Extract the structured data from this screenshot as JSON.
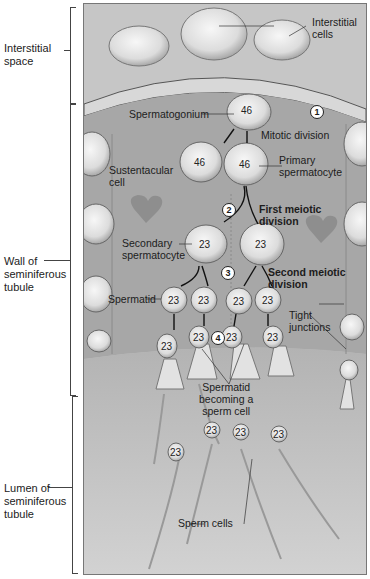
{
  "side_labels": {
    "interstitial_space": [
      "Interstitial",
      "space"
    ],
    "wall": [
      "Wall of",
      "seminiferous",
      "tubule"
    ],
    "lumen": [
      "Lumen of",
      "seminiferous",
      "tubule"
    ]
  },
  "labels": {
    "interstitial_cells": [
      "Interstitial",
      "cells"
    ],
    "spermatogonium": "Spermatogonium",
    "mitotic_division": "Mitotic division",
    "sustentacular_cell": [
      "Sustentacular",
      "cell"
    ],
    "primary_spermatocyte": [
      "Primary",
      "spermatocyte"
    ],
    "first_meiotic": [
      "First meiotic",
      "division"
    ],
    "secondary_spermatocyte": [
      "Secondary",
      "spermatocyte"
    ],
    "second_meiotic": [
      "Second meiotic",
      "division"
    ],
    "spermatid": "Spermatid",
    "tight_junctions": [
      "Tight",
      "junctions"
    ],
    "spermatid_becoming": [
      "Spermatid",
      "becoming a",
      "sperm cell"
    ],
    "sperm_cells": "Sperm cells"
  },
  "steps": [
    "1",
    "2",
    "3",
    "4"
  ],
  "chromosome_counts": {
    "spermatogonium": "46",
    "primary_left": "46",
    "primary_right": "46",
    "secondary_left": "23",
    "secondary_right": "23",
    "spermatids": [
      "23",
      "23",
      "23",
      "23"
    ],
    "developing": [
      "23",
      "23",
      "23",
      "23"
    ],
    "sperm": [
      "23",
      "23",
      "23",
      "23"
    ]
  },
  "colors": {
    "interstitial_bg": "#c4c4c4",
    "wall_bg": "#a9a9a9",
    "lumen_bg": "#c8c8c8",
    "cell_fill": "#e6e6e6",
    "border": "#555555"
  }
}
